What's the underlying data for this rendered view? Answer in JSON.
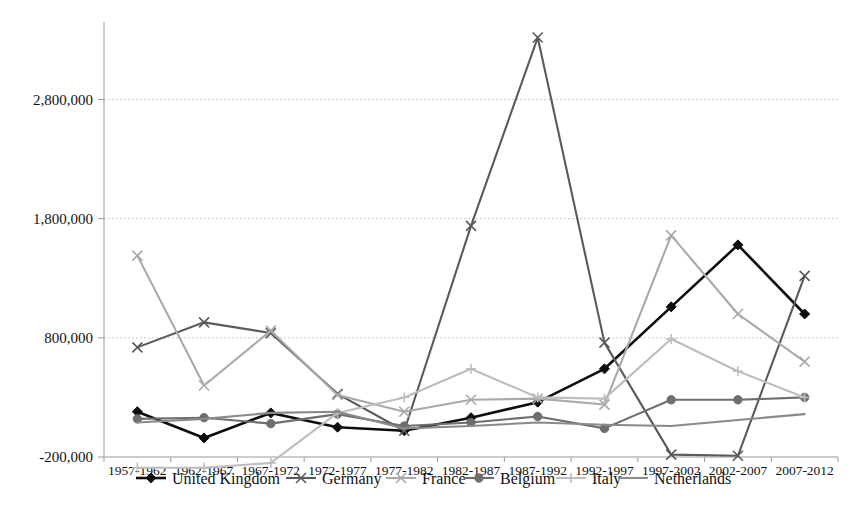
{
  "chart_data": {
    "type": "line",
    "title": "",
    "xlabel": "",
    "ylabel": "",
    "grid": true,
    "legend_position": "bottom",
    "ylim": [
      -200000,
      3400000
    ],
    "ytick_labels": [
      "2,800,000",
      "1,800,000",
      "800,000",
      "-200,000"
    ],
    "ytick_values": [
      2800000,
      1800000,
      800000,
      -200000
    ],
    "categories": [
      "1957-1962",
      "1962-1967",
      "1967-1972",
      "1972-1977",
      "1977-1982",
      "1982-1987",
      "1987-1992",
      "1992-1997",
      "1997-2002",
      "2002-2007",
      "2007-2012"
    ],
    "series": [
      {
        "name": "United Kingdom",
        "marker": "diamond",
        "color": "#0d0d0d",
        "values": [
          180000,
          -40000,
          170000,
          50000,
          20000,
          130000,
          260000,
          540000,
          1060000,
          1580000,
          1000000
        ]
      },
      {
        "name": "Germany",
        "marker": "x",
        "color": "#5a5a5a",
        "values": [
          720000,
          930000,
          840000,
          330000,
          20000,
          1740000,
          3320000,
          760000,
          -180000,
          -190000,
          1320000
        ]
      },
      {
        "name": "France",
        "marker": "x",
        "color": "#a9a9a9",
        "values": [
          1490000,
          400000,
          860000,
          320000,
          180000,
          280000,
          290000,
          240000,
          1660000,
          1000000,
          600000
        ]
      },
      {
        "name": "Belgium",
        "marker": "circle",
        "color": "#6e6e6e",
        "values": [
          120000,
          130000,
          80000,
          160000,
          60000,
          90000,
          140000,
          40000,
          280000,
          280000,
          300000
        ]
      },
      {
        "name": "Italy",
        "marker": "plus",
        "color": "#bdbdbd",
        "values": [
          -290000,
          -290000,
          -250000,
          170000,
          300000,
          540000,
          300000,
          290000,
          790000,
          520000,
          300000
        ]
      },
      {
        "name": "Netherlands",
        "marker": "none",
        "color": "#8a8a8a",
        "values": [
          90000,
          120000,
          170000,
          180000,
          40000,
          60000,
          90000,
          70000,
          60000,
          110000,
          160000
        ]
      }
    ]
  },
  "legend": {
    "items": [
      {
        "label": "United Kingdom"
      },
      {
        "label": "Germany"
      },
      {
        "label": "France"
      },
      {
        "label": "Belgium"
      },
      {
        "label": "Italy"
      },
      {
        "label": "Netherlands"
      }
    ]
  }
}
